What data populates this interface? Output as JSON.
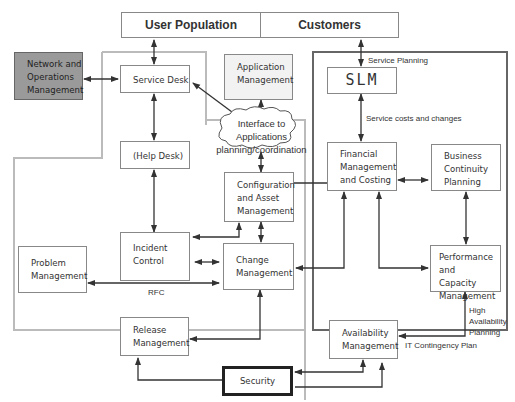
{
  "top": {
    "user_population": "User Population",
    "customers": "Customers"
  },
  "nodes": {
    "network_ops": [
      "Network and",
      "Operations",
      "Management"
    ],
    "service_desk": "Service Desk",
    "help_desk": "(Help Desk)",
    "application_mgmt": [
      "Application",
      "Management"
    ],
    "interface_cloud": [
      "Interface to Applications",
      "planning/coordination"
    ],
    "config_asset": [
      "Configuration",
      "and Asset",
      "Management"
    ],
    "incident_control": [
      "Incident",
      "Control"
    ],
    "problem_mgmt": [
      "Problem",
      "Management"
    ],
    "change_mgmt": [
      "Change",
      "Management"
    ],
    "release_mgmt": [
      "Release",
      "Management"
    ],
    "slm": "SLM",
    "financial": [
      "Financial",
      "Management",
      "and Costing"
    ],
    "business_continuity": [
      "Business",
      "Continuity",
      "Planning"
    ],
    "performance_capacity": [
      "Performance and",
      "Capacity",
      "Management"
    ],
    "availability": [
      "Availability",
      "Management"
    ],
    "security": "Security"
  },
  "edge_labels": {
    "service_planning": "Service Planning",
    "service_costs": "Service costs and changes",
    "rfc": "RFC",
    "high_availability": [
      "High",
      "Availability",
      "Planning"
    ],
    "it_contingency": "IT Contingency Plan"
  },
  "colors": {
    "network_fill": "#9a9a9a",
    "application_fill": "#f2f2f2",
    "left_region_border": "#b5b5b5",
    "right_region_border": "#666666",
    "arrow": "#333333"
  }
}
